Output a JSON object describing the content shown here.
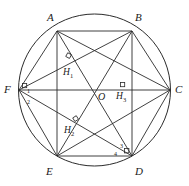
{
  "figure": {
    "type": "geometry-diagram",
    "stroke_color": "#2b2b2b",
    "label_color": "#1a1a1a",
    "background_color": "#ffffff",
    "circle": {
      "cx": 94.5,
      "cy": 90,
      "r": 76
    },
    "vertices": [
      {
        "name": "A",
        "label": "A",
        "x": 57,
        "y": 31,
        "label_x": 47,
        "label_y": 12
      },
      {
        "name": "B",
        "label": "B",
        "x": 132,
        "y": 31,
        "label_x": 135,
        "label_y": 12
      },
      {
        "name": "C",
        "label": "C",
        "x": 170,
        "y": 90,
        "label_x": 175,
        "label_y": 84
      },
      {
        "name": "D",
        "label": "D",
        "x": 132,
        "y": 156,
        "label_x": 135,
        "label_y": 166
      },
      {
        "name": "E",
        "label": "E",
        "x": 57,
        "y": 156,
        "label_x": 46,
        "label_y": 166
      },
      {
        "name": "F",
        "label": "F",
        "x": 19,
        "y": 90,
        "label_x": 4,
        "label_y": 84
      }
    ],
    "interior_points": [
      {
        "name": "O",
        "label": "O",
        "x": 94.5,
        "y": 90,
        "label_x": 98,
        "label_y": 92
      },
      {
        "name": "H1",
        "label": "H",
        "sub": "1",
        "x": 70,
        "y": 60,
        "label_x": 63,
        "label_y": 68
      },
      {
        "name": "H3",
        "label": "H",
        "sub": "3",
        "x": 124,
        "y": 90,
        "label_x": 116,
        "label_y": 92
      },
      {
        "name": "H2",
        "label": "H",
        "sub": "2",
        "x": 76,
        "y": 124,
        "label_x": 64,
        "label_y": 126
      }
    ],
    "angle_labels": [
      {
        "name": "angle-1",
        "label": "1",
        "x": 27,
        "y": 88
      },
      {
        "name": "angle-2",
        "label": "2",
        "x": 27,
        "y": 99
      },
      {
        "name": "angle-3",
        "label": "3",
        "x": 120,
        "y": 143
      },
      {
        "name": "angle-4",
        "label": "4",
        "x": 114,
        "y": 151
      }
    ],
    "right_angle_marks": [
      {
        "name": "right-angle-h1",
        "x": 68,
        "y": 55
      },
      {
        "name": "right-angle-h3",
        "x": 122,
        "y": 84
      },
      {
        "name": "right-angle-h2",
        "x": 75,
        "y": 118
      },
      {
        "name": "right-angle-d",
        "x": 126,
        "y": 150
      },
      {
        "name": "right-angle-f",
        "x": 24,
        "y": 85
      }
    ],
    "edges": [
      [
        "A",
        "B"
      ],
      [
        "B",
        "C"
      ],
      [
        "C",
        "D"
      ],
      [
        "D",
        "E"
      ],
      [
        "E",
        "F"
      ],
      [
        "F",
        "A"
      ],
      [
        "A",
        "C"
      ],
      [
        "A",
        "D"
      ],
      [
        "A",
        "E"
      ],
      [
        "B",
        "D"
      ],
      [
        "B",
        "E"
      ],
      [
        "B",
        "F"
      ],
      [
        "C",
        "E"
      ],
      [
        "C",
        "F"
      ],
      [
        "D",
        "F"
      ],
      [
        "F",
        "C"
      ],
      [
        "A",
        "O"
      ],
      [
        "O",
        "D"
      ]
    ]
  }
}
